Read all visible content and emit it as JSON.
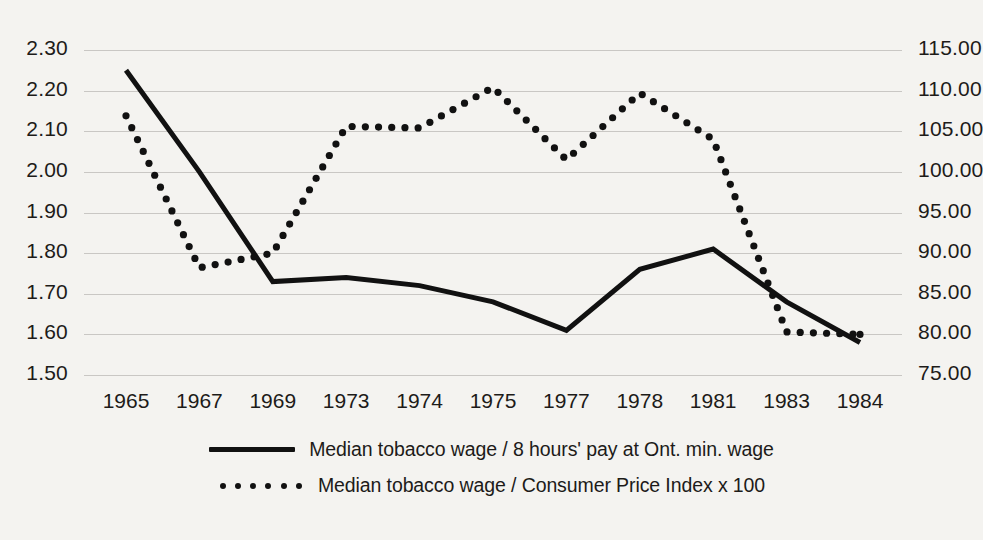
{
  "chart_data": {
    "type": "line",
    "title": "",
    "xlabel": "",
    "ylabel": "",
    "categories": [
      "1965",
      "1967",
      "1969",
      "1973",
      "1974",
      "1975",
      "1977",
      "1978",
      "1981",
      "1983",
      "1984"
    ],
    "grid": true,
    "legend_position": "bottom",
    "axes": {
      "left": {
        "label": "",
        "ylim": [
          1.5,
          2.3
        ],
        "ticks": [
          "1.50",
          "1.60",
          "1.70",
          "1.80",
          "1.90",
          "2.00",
          "2.10",
          "2.20",
          "2.30"
        ],
        "tick_values": [
          1.5,
          1.6,
          1.7,
          1.8,
          1.9,
          2.0,
          2.1,
          2.2,
          2.3
        ]
      },
      "right": {
        "label": "",
        "ylim": [
          75.0,
          115.0
        ],
        "ticks": [
          "75.00",
          "80.00",
          "85.00",
          "90.00",
          "95.00",
          "100.00",
          "105.00",
          "110.00",
          "115.00"
        ],
        "tick_values": [
          75,
          80,
          85,
          90,
          95,
          100,
          105,
          110,
          115
        ]
      }
    },
    "series": [
      {
        "name": "Median tobacco wage / 8 hours' pay at Ont. min. wage",
        "axis": "left",
        "style": "solid",
        "color": "#111111",
        "values": [
          2.25,
          2.0,
          1.73,
          1.74,
          1.72,
          1.68,
          1.61,
          1.76,
          1.81,
          1.68,
          1.58
        ]
      },
      {
        "name": "Median tobacco wage / Consumer Price Index x 100",
        "axis": "right",
        "style": "dotted",
        "color": "#111111",
        "values": [
          106.9,
          88.2,
          90.0,
          105.6,
          105.4,
          110.4,
          101.5,
          109.7,
          104.0,
          80.3,
          80.0
        ]
      }
    ]
  },
  "legend": {
    "entries": [
      {
        "label": "Median tobacco wage / 8 hours' pay at Ont. min. wage",
        "key": "solid-line-key"
      },
      {
        "label": "Median tobacco wage / Consumer Price Index x 100",
        "key": "dotted-line-key"
      }
    ]
  }
}
